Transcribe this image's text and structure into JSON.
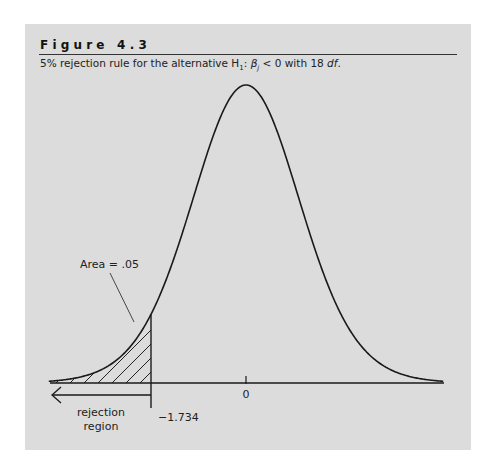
{
  "figure": {
    "title": "Figure 4.3",
    "caption_parts": {
      "prefix": "5% rejection rule for the alternative H",
      "sub1": "1",
      "colon": ": ",
      "beta": "β",
      "subj": "j",
      "rest": " < 0 with 18 ",
      "df": "df",
      "end": "."
    }
  },
  "chart_data": {
    "type": "area",
    "title": "Figure 4.3",
    "subtitle": "5% rejection rule for the alternative H1: βj < 0 with 18 df.",
    "distribution": "Student t",
    "df": 18,
    "x_range": [
      -3.6,
      3.6
    ],
    "xlabel": "",
    "ylabel": "",
    "ticks": [
      {
        "value": 0,
        "label": "0"
      }
    ],
    "critical_value": -1.734,
    "critical_label": "−1.734",
    "shaded_region": {
      "from": -3.6,
      "to": -1.734,
      "pattern": "diagonal hatch",
      "area": 0.05
    },
    "annotations": [
      {
        "text": "Area = .05",
        "target": "shaded left tail"
      },
      {
        "text": "rejection region",
        "lines": [
          "rejection",
          "region"
        ],
        "arrow": "left"
      }
    ],
    "grid": false,
    "legend": "none"
  },
  "labels": {
    "area": "Area = .05",
    "rejection_line1": "rejection",
    "rejection_line2": "region",
    "critical": "−1.734",
    "zero": "0"
  }
}
